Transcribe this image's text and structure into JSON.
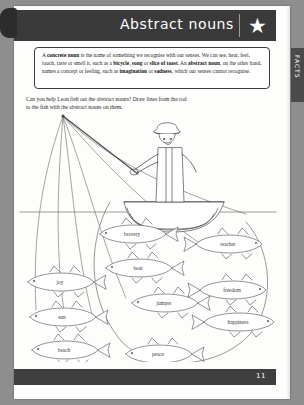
{
  "header": {
    "title": "Abstract nouns",
    "star_icon": "★"
  },
  "side_tab": {
    "label": "FACTS"
  },
  "fact_box": {
    "line1_a": "A ",
    "line1_b": "concrete noun",
    "line1_c": " is the name of something we recognise with our senses. We can",
    "line2_a": "see, hear, feel, touch, taste or smell it, such as a ",
    "line2_b": "bicycle",
    "line2_c": ", ",
    "line2_d": "song",
    "line2_e": " or ",
    "line2_f": "slice of toast",
    "line2_g": ".",
    "line3_a": "An ",
    "line3_b": "abstract noun",
    "line3_c": ", on the other hand, names a concept or feeling, such as",
    "line4_a": "imagination",
    "line4_b": " or ",
    "line4_c": "sadness",
    "line4_d": ", which our senses cannot recognise."
  },
  "instructions": {
    "line1": "Can you help Leon fish out the abstract nouns? Draw lines from the rod",
    "line2": "to the fish with the abstract nouns on them."
  },
  "illustration": {
    "scene": "boy-fishing-in-rowing-boat",
    "character_name": "Leon",
    "fish": [
      {
        "label": "bravery",
        "abstract": true,
        "x": 118,
        "y": 124
      },
      {
        "label": "teacher",
        "abstract": false,
        "x": 212,
        "y": 134
      },
      {
        "label": "boat",
        "abstract": false,
        "x": 124,
        "y": 158
      },
      {
        "label": "joy",
        "abstract": true,
        "x": 44,
        "y": 172
      },
      {
        "label": "freedom",
        "abstract": true,
        "x": 216,
        "y": 180
      },
      {
        "label": "jumper",
        "abstract": false,
        "x": 150,
        "y": 193
      },
      {
        "label": "sun",
        "abstract": false,
        "x": 46,
        "y": 207
      },
      {
        "label": "happiness",
        "abstract": true,
        "x": 222,
        "y": 212
      },
      {
        "label": "beach",
        "abstract": false,
        "x": 48,
        "y": 240
      },
      {
        "label": "peace",
        "abstract": true,
        "x": 143,
        "y": 244
      }
    ]
  },
  "footer": {
    "page_number": "11"
  },
  "colors": {
    "header_band": "#3a3a3a",
    "footer_band": "#3f3f3f",
    "side_tab": "#4a4a4a",
    "paper": "#fdfdfb",
    "ink": "#3a3a3a",
    "scan_background": "#8e8e8e"
  }
}
